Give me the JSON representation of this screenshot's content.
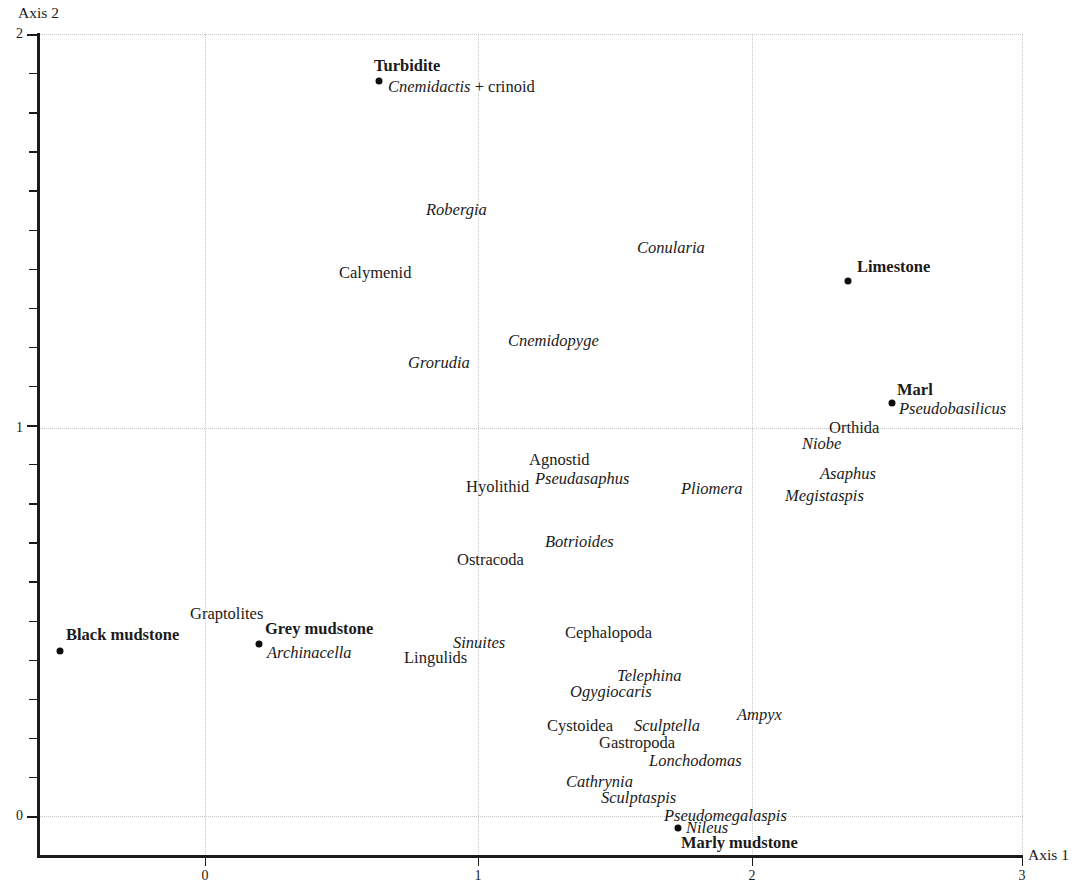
{
  "figure": {
    "type": "scatter",
    "background": "#ffffff",
    "point_color": "#0d0d0d",
    "grid_color": "#c9c9c9",
    "axis_color": "#1b1b1b"
  },
  "axes": {
    "x_title": "Axis 1",
    "y_title": "Axis 2",
    "x_ticks": [
      "0",
      "1",
      "2",
      "3"
    ],
    "x_tick_values": [
      0,
      1,
      2,
      3
    ],
    "y_ticks": [
      "0",
      "1",
      "2"
    ],
    "y_tick_values": [
      0,
      1,
      2
    ],
    "xlim": [
      -0.75,
      3.0
    ],
    "ylim": [
      -0.09,
      2.0
    ],
    "grid": "dotted"
  },
  "chart_data": {
    "type": "scatter",
    "title": "",
    "xlabel": "Axis 1",
    "ylabel": "Axis 2",
    "xlim": [
      -0.75,
      3.0
    ],
    "ylim": [
      -0.09,
      2.0
    ],
    "xticks": [
      0,
      1,
      2,
      3
    ],
    "yticks": [
      0,
      1,
      2
    ],
    "grid": true,
    "legend": "none",
    "series": [
      {
        "name": "Lithology samples",
        "style": "bold-label-with-dot",
        "points": [
          {
            "label": "Turbidite",
            "x": 0.635,
            "y": 1.925,
            "dot": true
          },
          {
            "label": "Limestone",
            "x": 2.355,
            "y": 1.395,
            "dot": true
          },
          {
            "label": "Marl",
            "x": 2.515,
            "y": 1.085,
            "dot": true
          },
          {
            "label": "Black mudstone",
            "x": -0.53,
            "y": 0.465,
            "dot": true
          },
          {
            "label": "Grey mudstone",
            "x": 0.195,
            "y": 0.445,
            "dot": true
          },
          {
            "label": "Marly mudstone",
            "x": 1.725,
            "y": 0.015,
            "dot": true
          }
        ]
      },
      {
        "name": "Taxa",
        "style": "italic-label",
        "points": [
          {
            "label": "Cnemidactis + crinoid",
            "x": 0.645,
            "y": 1.905,
            "dot": false
          },
          {
            "label": "Robergia",
            "x": 0.545,
            "y": 1.605,
            "dot": false
          },
          {
            "label": "Conularia",
            "x": 1.435,
            "y": 1.505,
            "dot": false
          },
          {
            "label": "Calymenid",
            "x": 0.4,
            "y": 1.425,
            "dot": false
          },
          {
            "label": "Cnemidopyge",
            "x": 0.74,
            "y": 1.27,
            "dot": false
          },
          {
            "label": "Grorudia",
            "x": 0.535,
            "y": 1.205,
            "dot": false
          },
          {
            "label": "Pseudobasilicus",
            "x": 2.62,
            "y": 1.06,
            "dot": false
          },
          {
            "label": "Orthida",
            "x": 2.215,
            "y": 0.98,
            "dot": false
          },
          {
            "label": "Niobe",
            "x": 2.1,
            "y": 0.935,
            "dot": false
          },
          {
            "label": "Agnostid",
            "x": 0.995,
            "y": 0.89,
            "dot": false
          },
          {
            "label": "Asaphus",
            "x": 2.245,
            "y": 0.855,
            "dot": false
          },
          {
            "label": "Pseudasaphus",
            "x": 1.06,
            "y": 0.855,
            "dot": false
          },
          {
            "label": "Hyolithid",
            "x": 0.835,
            "y": 0.845,
            "dot": false
          },
          {
            "label": "Pliomera",
            "x": 1.71,
            "y": 0.835,
            "dot": false
          },
          {
            "label": "Megistaspis",
            "x": 2.205,
            "y": 0.825,
            "dot": false
          },
          {
            "label": "Botrioides",
            "x": 1.1,
            "y": 0.715,
            "dot": false
          },
          {
            "label": "Ostracoda",
            "x": 0.845,
            "y": 0.65,
            "dot": false
          },
          {
            "label": "Graptolites",
            "x": 0.01,
            "y": 0.505,
            "dot": false
          },
          {
            "label": "Cephalopoda",
            "x": 1.215,
            "y": 0.455,
            "dot": false
          },
          {
            "label": "Sinuites",
            "x": 0.83,
            "y": 0.43,
            "dot": false
          },
          {
            "label": "Archinacella",
            "x": 0.31,
            "y": 0.415,
            "dot": false
          },
          {
            "label": "Lingulids",
            "x": 0.67,
            "y": 0.39,
            "dot": false
          },
          {
            "label": "Telephina",
            "x": 1.4,
            "y": 0.34,
            "dot": false
          },
          {
            "label": "Ogygiocaris",
            "x": 1.255,
            "y": 0.31,
            "dot": false
          },
          {
            "label": "Ampyx",
            "x": 1.895,
            "y": 0.24,
            "dot": false
          },
          {
            "label": "Sculptella",
            "x": 1.47,
            "y": 0.225,
            "dot": false
          },
          {
            "label": "Cystoidea",
            "x": 1.14,
            "y": 0.225,
            "dot": false
          },
          {
            "label": "Gastropoda",
            "x": 1.36,
            "y": 0.185,
            "dot": false
          },
          {
            "label": "Lonchodomas",
            "x": 1.56,
            "y": 0.15,
            "dot": false
          },
          {
            "label": "Cathrynia",
            "x": 1.23,
            "y": 0.105,
            "dot": false
          },
          {
            "label": "Sculptaspis",
            "x": 1.32,
            "y": 0.07,
            "dot": false
          },
          {
            "label": "Pseudomegalaspis",
            "x": 1.5,
            "y": 0.03,
            "dot": false
          },
          {
            "label": "Nileus",
            "x": 1.76,
            "y": 0.01,
            "dot": false
          }
        ]
      }
    ]
  },
  "labels": {
    "turbidite": "Turbidite",
    "cnemidactis": "Cnemidactis",
    "cnemidactis_suffix": " + crinoid",
    "robergia": "Robergia",
    "conularia": "Conularia",
    "calymenid": "Calymenid",
    "limestone": "Limestone",
    "cnemidopyge": "Cnemidopyge",
    "grorudia": "Grorudia",
    "marl": "Marl",
    "pseudobasilicus": "Pseudobasilicus",
    "orthida": "Orthida",
    "niobe": "Niobe",
    "agnostid": "Agnostid",
    "asaphus": "Asaphus",
    "pseudasaphus": "Pseudasaphus",
    "hyolithid": "Hyolithid",
    "pliomera": "Pliomera",
    "megistaspis": "Megistaspis",
    "botrioides": "Botrioides",
    "ostracoda": "Ostracoda",
    "graptolites": "Graptolites",
    "black_mudstone": "Black mudstone",
    "grey_mudstone": "Grey mudstone",
    "archinacella": "Archinacella",
    "sinuites": "Sinuites",
    "cephalopoda": "Cephalopoda",
    "lingulids": "Lingulids",
    "telephina": "Telephina",
    "ogygiocaris": "Ogygiocaris",
    "cystoidea": "Cystoidea",
    "sculptella": "Sculptella",
    "ampyx": "Ampyx",
    "gastropoda": "Gastropoda",
    "lonchodomas": "Lonchodomas",
    "cathrynia": "Cathrynia",
    "sculptaspis": "Sculptaspis",
    "pseudomegalaspis": "Pseudomegalaspis",
    "nileus": "Nileus",
    "marly_mudstone": "Marly mudstone"
  }
}
